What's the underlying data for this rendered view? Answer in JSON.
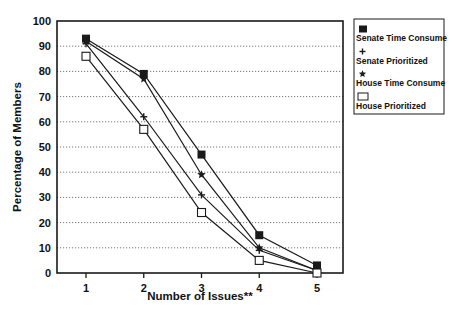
{
  "chart_data": {
    "type": "line",
    "title": "",
    "xlabel": "Number of Issues**",
    "ylabel": "Percentage of Members",
    "x": [
      1,
      2,
      3,
      4,
      5
    ],
    "categories": [
      "1",
      "2",
      "3",
      "4",
      "5"
    ],
    "ylim": [
      0,
      100
    ],
    "yticks": [
      0,
      10,
      20,
      30,
      40,
      50,
      60,
      70,
      80,
      90,
      100
    ],
    "grid": "horizontal dotted",
    "legend_position": "right",
    "series": [
      {
        "name": "Senate Time Consume",
        "marker": "filled-square",
        "values": [
          93,
          79,
          47,
          15,
          3
        ]
      },
      {
        "name": "Senate Prioritized",
        "marker": "plus",
        "values": [
          91,
          62,
          31,
          9,
          1
        ]
      },
      {
        "name": "House Time Consume",
        "marker": "star",
        "values": [
          92,
          77,
          39,
          10,
          1
        ]
      },
      {
        "name": "House Prioritized",
        "marker": "open-square",
        "values": [
          86,
          57,
          24,
          5,
          0
        ]
      }
    ]
  },
  "colors": {
    "line": "#1a1a1a",
    "grid": "#555555",
    "background": "#ffffff"
  }
}
